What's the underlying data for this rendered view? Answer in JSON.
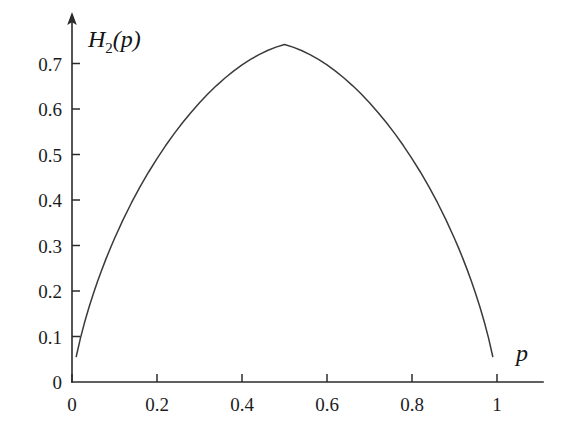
{
  "figure": {
    "background_color": "#ffffff",
    "curve_color": "#3a3a3a",
    "axis_color": "#2b2b2b"
  },
  "chart_data": {
    "type": "line",
    "title": "",
    "subtitle": "",
    "xlabel": "p",
    "ylabel": "H_2(p)",
    "ylabel_base": "H",
    "ylabel_subscript": "2",
    "ylabel_arg": "(p)",
    "xlim": [
      0,
      1.08
    ],
    "ylim": [
      0,
      0.78
    ],
    "grid": false,
    "legend": null,
    "legend_position": "none",
    "y_axis_has_arrow": true,
    "x_tick_labels": [
      "0",
      "0.2",
      "0.4",
      "0.6",
      "0.8",
      "1"
    ],
    "x_ticks": [
      0,
      0.2,
      0.4,
      0.6,
      0.8,
      1
    ],
    "y_tick_labels": [
      "0",
      "0.1",
      "0.2",
      "0.3",
      "0.4",
      "0.5",
      "0.6",
      "0.7"
    ],
    "y_ticks": [
      0,
      0.1,
      0.2,
      0.3,
      0.4,
      0.5,
      0.6,
      0.7
    ],
    "series": [
      {
        "name": "H_2(p)",
        "x": [
          0.01,
          0.02,
          0.03,
          0.04,
          0.05,
          0.06,
          0.07,
          0.08,
          0.09,
          0.1,
          0.12,
          0.14,
          0.16,
          0.18,
          0.2,
          0.22,
          0.24,
          0.26,
          0.28,
          0.3,
          0.32,
          0.34,
          0.36,
          0.38,
          0.4,
          0.42,
          0.44,
          0.46,
          0.48,
          0.5,
          0.52,
          0.54,
          0.56,
          0.58,
          0.6,
          0.62,
          0.64,
          0.66,
          0.68,
          0.7,
          0.72,
          0.74,
          0.76,
          0.78,
          0.8,
          0.82,
          0.84,
          0.86,
          0.88,
          0.9,
          0.91,
          0.92,
          0.93,
          0.94,
          0.95,
          0.96,
          0.97,
          0.98,
          0.99
        ],
        "y": [
          0.056,
          0.097,
          0.1323,
          0.1642,
          0.1935,
          0.2208,
          0.2464,
          0.2706,
          0.2936,
          0.3154,
          0.3564,
          0.394,
          0.4287,
          0.461,
          0.4911,
          0.5191,
          0.5453,
          0.5697,
          0.5925,
          0.6137,
          0.6334,
          0.6515,
          0.6682,
          0.6833,
          0.697,
          0.7091,
          0.7196,
          0.7286,
          0.736,
          0.7419,
          0.736,
          0.7286,
          0.7196,
          0.7091,
          0.697,
          0.6833,
          0.6682,
          0.6515,
          0.6334,
          0.6137,
          0.5925,
          0.5697,
          0.5453,
          0.5191,
          0.4911,
          0.461,
          0.4287,
          0.394,
          0.3564,
          0.3154,
          0.2936,
          0.2706,
          0.2464,
          0.2208,
          0.1935,
          0.1642,
          0.1323,
          0.097,
          0.056
        ],
        "y_unit": "bits",
        "peak": {
          "x": 0.5,
          "y": 0.7419
        },
        "formula": "H2(p) = -p*log2(p) - (1-p)*log2(1-p)"
      }
    ]
  }
}
